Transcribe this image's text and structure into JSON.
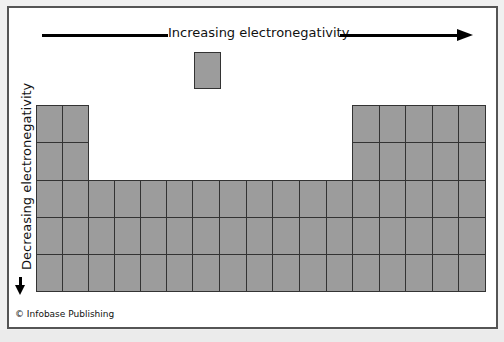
{
  "diagram": {
    "horizontal_arrow": {
      "label": "Increasing electronegativity",
      "direction": "right"
    },
    "vertical_arrow": {
      "label": "Decreasing electronegativity",
      "direction": "down"
    },
    "credit": "© Infobase Publishing",
    "colors": {
      "cell_fill": "#9c9c9c",
      "cell_border": "#333333",
      "frame_border": "#555555",
      "arrow": "#000000"
    },
    "grid": {
      "columns": 18,
      "rows": 5,
      "hydrogen_cell": "single detached cell above column 7",
      "layout": "left block 2 columns x 5 rows; middle block 10 columns x 3 rows (rows 3-5); right block 6 columns x 5 rows"
    }
  }
}
